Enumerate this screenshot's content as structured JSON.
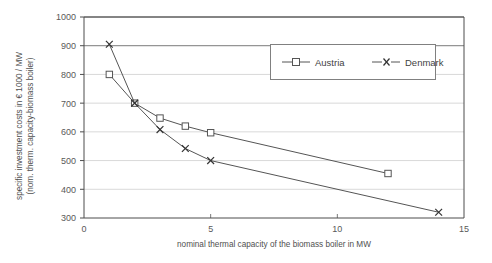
{
  "chart_data": {
    "type": "line",
    "title": "",
    "xlabel": "nominal thermal capacity of the biomass boiler in MW",
    "ylabel_line1": "specific investment costs in € 1000 / MW",
    "ylabel_line2": "(nom. therm. capacity-biomass boiler)",
    "xlim": [
      0,
      15
    ],
    "ylim": [
      300,
      1000
    ],
    "xticks": [
      0,
      5,
      10,
      15
    ],
    "xtick_labels": [
      "0",
      "5",
      "10",
      "15"
    ],
    "yticks": [
      300,
      400,
      500,
      600,
      700,
      800,
      900,
      1000
    ],
    "ytick_labels": [
      "300",
      "400",
      "500",
      "600",
      "700",
      "800",
      "900",
      "1000"
    ],
    "grid": "horizontal",
    "legend_position": "top-right-inside",
    "series": [
      {
        "name": "Austria",
        "marker": "square",
        "line_style": "solid",
        "color": "#555555",
        "x": [
          1,
          2,
          3,
          4,
          5,
          12
        ],
        "y": [
          800,
          700,
          648,
          620,
          597,
          455
        ]
      },
      {
        "name": "Denmark",
        "marker": "x",
        "line_style": "solid",
        "color": "#555555",
        "x": [
          1,
          2,
          3,
          4,
          5,
          14
        ],
        "y": [
          905,
          700,
          608,
          542,
          500,
          320
        ]
      }
    ]
  },
  "legend": {
    "entries": [
      {
        "label": "Austria"
      },
      {
        "label": "Denmark"
      }
    ]
  },
  "colors": {
    "axis": "#4d4d4d",
    "grid": "#d9d9d9",
    "grid_emphasis": "#7a7a7a",
    "series": "#555555",
    "text": "#4f4f4f",
    "legend_border": "#808080",
    "background": "#ffffff"
  }
}
